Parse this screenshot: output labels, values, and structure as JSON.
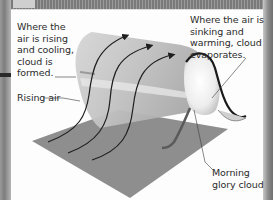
{
  "diagram": {
    "labels": {
      "rising_cooling": "Where the air is rising and cooling, cloud is formed.",
      "sinking_warming": "Where the air is sinking and warming, cloud evaporates.",
      "rising_air": "Rising air",
      "cloud_name": "Morning glory cloud"
    },
    "elements": {
      "ground_plane": "gray ground surface",
      "cloud_sheet": "rolling air sheet / cloud band",
      "airflow_arrows": 4
    },
    "colors": {
      "panel_background": "#fdfdfd",
      "ground": "#8e8e8e",
      "cloud_sheet": "#c9c9c9",
      "cloud_tube": "#f2f2f2",
      "arrows": "#1e1e1e",
      "text": "#2b2b2b"
    }
  }
}
